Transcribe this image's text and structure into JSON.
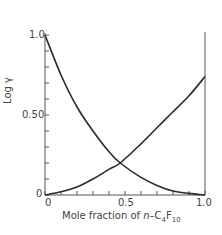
{
  "chart_data": {
    "type": "line",
    "title": "",
    "xlabel": "Mole fraction of n-C4F10",
    "ylabel": "Log γ",
    "xlim": [
      0,
      1.0
    ],
    "ylim": [
      0,
      1.0
    ],
    "x_ticks": [
      "0",
      "0.5",
      "1.0"
    ],
    "y_ticks": [
      "0",
      "0.50",
      "1.0"
    ],
    "minor_tick_step": 0.1,
    "grid": false,
    "legend": null,
    "x": [
      0,
      0.1,
      0.2,
      0.3,
      0.4,
      0.47,
      0.6,
      0.7,
      0.8,
      0.9,
      1.0
    ],
    "series": [
      {
        "name": "decreasing curve",
        "values": [
          1.0,
          0.75,
          0.55,
          0.4,
          0.27,
          0.2,
          0.11,
          0.06,
          0.025,
          0.01,
          0.0
        ]
      },
      {
        "name": "increasing curve",
        "values": [
          0.0,
          0.02,
          0.05,
          0.1,
          0.16,
          0.2,
          0.32,
          0.42,
          0.52,
          0.62,
          0.74
        ]
      }
    ],
    "annotations": [
      "curves intersect near x ≈ 0.47, log γ ≈ 0.20"
    ]
  },
  "labels": {
    "y_top": "1.0",
    "y_mid": "0.50",
    "y_zero": "0",
    "x_zero": "0",
    "x_mid": "0.5",
    "x_end": "1.0",
    "ylabel": "Log γ",
    "xlabel_prefix": "Mole fraction of ",
    "xlabel_n": "n",
    "xlabel_mid": "–C",
    "xlabel_sub1": "4",
    "xlabel_f": "F",
    "xlabel_sub2": "10"
  },
  "colors": {
    "line": "#2a2a2a",
    "axis": "#555555"
  }
}
